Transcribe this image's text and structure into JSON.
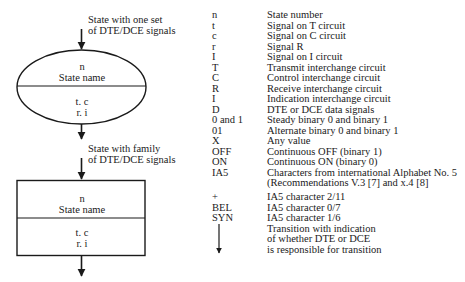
{
  "diagram": {
    "single_state": {
      "caption": [
        "State with one set",
        "of DTE/DCE signals"
      ],
      "top": [
        "n",
        "State name"
      ],
      "bottom": [
        "t. c",
        "r. i"
      ]
    },
    "family_state": {
      "caption": [
        "State with family",
        "of DTE/DCE signals"
      ],
      "top": [
        "n",
        "State name"
      ],
      "bottom": [
        "t. c",
        "r. i"
      ]
    }
  },
  "legend": [
    {
      "symbol": "n",
      "meaning": "State number"
    },
    {
      "symbol": "t",
      "meaning": "Signal on T circuit"
    },
    {
      "symbol": "c",
      "meaning": "Signal on C circuit"
    },
    {
      "symbol": "r",
      "meaning": "Signal R"
    },
    {
      "symbol": "I",
      "meaning": "Signal on I circuit"
    },
    {
      "symbol": "T",
      "meaning": "Transmit interchange circuit"
    },
    {
      "symbol": "C",
      "meaning": "Control interchange circuit"
    },
    {
      "symbol": "R",
      "meaning": "Receive interchange circuit"
    },
    {
      "symbol": "I",
      "meaning": "Indication interchange circuit"
    },
    {
      "symbol": "D",
      "meaning": "DTE or DCE data signals"
    },
    {
      "symbol": "0 and 1",
      "meaning": "Steady binary 0 and binary 1"
    },
    {
      "symbol": "01",
      "meaning": "Alternate binary 0 and binary 1"
    },
    {
      "symbol": "X",
      "meaning": "Any value"
    },
    {
      "symbol": "OFF",
      "meaning": "Continuous OFF (binary 1)"
    },
    {
      "symbol": "ON",
      "meaning": "Continuous ON (binary 0)"
    },
    {
      "symbol": "IA5",
      "meaning": "Characters from international Alphabet No. 5"
    },
    {
      "symbol": "",
      "meaning": "(Recommendations V.3 [7] and x.4 [8]"
    },
    {
      "symbol": "+",
      "meaning": "IA5 character 2/11"
    },
    {
      "symbol": "BEL",
      "meaning": "IA5 character 0/7"
    },
    {
      "symbol": "SYN",
      "meaning": "IA5 character 1/6"
    },
    {
      "symbol": "",
      "meaning": "Transition with indication"
    },
    {
      "symbol": "",
      "meaning": "of whether DTE or DCE"
    },
    {
      "symbol": "",
      "meaning": "is responsible for transition"
    }
  ],
  "legend_transition_symbol": "down-arrow-icon"
}
